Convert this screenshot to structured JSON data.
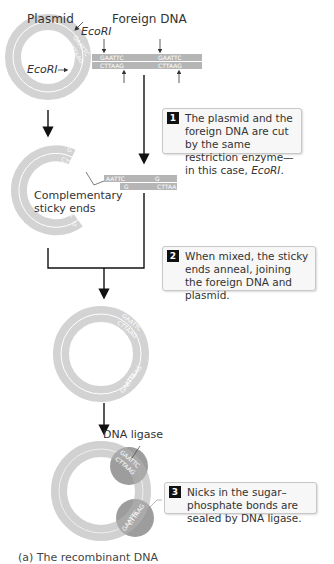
{
  "labels": {
    "plasmid": "Plasmid",
    "foreign_dna": "Foreign DNA",
    "ecori_top": "EcoRI",
    "ecori_left": "EcoRI",
    "complementary": "Complementary",
    "sticky_ends": "sticky ends",
    "dna_ligase": "DNA ligase"
  },
  "sequences": {
    "site_top": "GAATTC",
    "site_bottom": "CTTAAG",
    "cut_left_top": "AATTC",
    "cut_left_bottom": "G",
    "cut_right_top": "G",
    "cut_right_bottom": "CTTAA"
  },
  "steps": [
    {
      "num": "1",
      "text_a": "The plasmid and the foreign DNA are cut by the same restriction enzyme—in this case, ",
      "text_em": "EcoRI",
      "text_b": "."
    },
    {
      "num": "2",
      "text": "When mixed, the sticky ends anneal, joining the foreign DNA and plasmid."
    },
    {
      "num": "3",
      "text": "Nicks in the sugar–phosphate bonds are sealed by DNA ligase."
    }
  ],
  "colors": {
    "ring": "#d3d3d3",
    "ring_line": "#ffffff",
    "dna_bar": "#b5b5b5",
    "ligase": "#8c8c8c",
    "arrow": "#111111"
  },
  "caption": "(a) The recombinant DNA"
}
